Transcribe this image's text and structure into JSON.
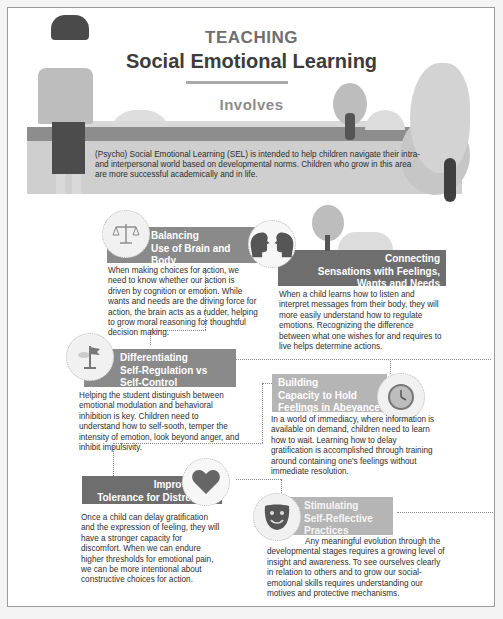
{
  "header": {
    "teaching": "TEACHING",
    "title": "Social Emotional Learning",
    "involves": "Involves"
  },
  "intro": "(Psycho) Social Emotional Learning (SEL) is intended to help children navigate their intra- and interpersonal world based on developmental norms. Children who grow in this area are more successful academically and in life.",
  "cards": [
    {
      "title_lines": [
        "Balancing",
        "Use of Brain and",
        "Body"
      ],
      "icon": "scale-icon",
      "body": "When making choices for action, we need to know whether our action is driven by cognition or emotion. While wants and needs are the driving force for action, the brain acts as a rudder, helping to grow moral reasoning for thoughtful decision making."
    },
    {
      "title_lines": [
        "Connecting",
        "Sensations with Feelings,",
        "Wants and Needs"
      ],
      "icon": "two-heads-icon",
      "body": "When a child learns how to listen and interpret messages from their body, they will more easily understand how to regulate emotions. Recognizing the difference between what one wishes for and requires to live helps determine actions."
    },
    {
      "title_lines": [
        "Differentiating",
        "Self-Regulation vs",
        "Self-Control"
      ],
      "icon": "flag-icon",
      "body": "Helping the student distinguish between emotional modulation and behavioral inhibition is key. Children need to understand how to self-sooth, temper the intensity of emotion, look beyond anger, and inhibit impulsivity."
    },
    {
      "title_lines": [
        "Building",
        "Capacity to Hold",
        "Feelings in Abeyance"
      ],
      "icon": "clock-icon",
      "body": "In a world of immediacy, where information is available on demand, children need to learn how to wait. Learning how to delay gratification is accomplished through training around containing one's feelings without immediate resolution."
    },
    {
      "title_lines": [
        "Improving",
        "Tolerance for Distress"
      ],
      "icon": "heart-icon",
      "body": "Once a child can delay gratification and the expression of feeling, they will have a stronger capacity for discomfort. When we can endure higher thresholds for emotional pain, we can be more intentional about constructive choices for action."
    },
    {
      "title_lines": [
        "Stimulating",
        "Self-Reflective",
        "Practices"
      ],
      "icon": "mask-icon",
      "body": "Any meaningful evolution through the developmental stages requires a growing level of insight and awareness. To see ourselves clearly in relation to others and to grow our social-emotional skills requires understanding our motives and protective mechanisms."
    }
  ]
}
